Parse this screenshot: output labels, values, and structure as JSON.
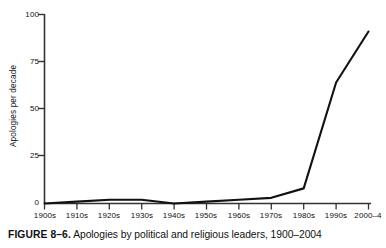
{
  "figure": {
    "caption_label": "FIGURE 8–6.",
    "caption_text": " Apologies by political and religious leaders, 1900–2004"
  },
  "chart_data": {
    "type": "line",
    "title": "",
    "subtitle": "",
    "xlabel": "",
    "ylabel": "Apologies per decade",
    "categories": [
      "1900s",
      "1910s",
      "1920s",
      "1930s",
      "1940s",
      "1950s",
      "1960s",
      "1970s",
      "1980s",
      "1990s",
      "2000–4"
    ],
    "values": [
      0,
      1,
      2,
      2,
      0,
      1,
      2,
      3,
      8,
      64,
      91
    ],
    "ylim": [
      0,
      100
    ],
    "yticks": [
      0,
      25,
      50,
      75,
      100
    ],
    "ytick_labels": [
      "0",
      "25",
      "50",
      "75",
      "100"
    ],
    "grid": false,
    "legend": "none",
    "line_color": "#111111",
    "axis_color": "#333333",
    "series": [
      {
        "name": "Apologies per decade",
        "values": [
          0,
          1,
          2,
          2,
          0,
          1,
          2,
          3,
          8,
          64,
          91
        ]
      }
    ]
  }
}
